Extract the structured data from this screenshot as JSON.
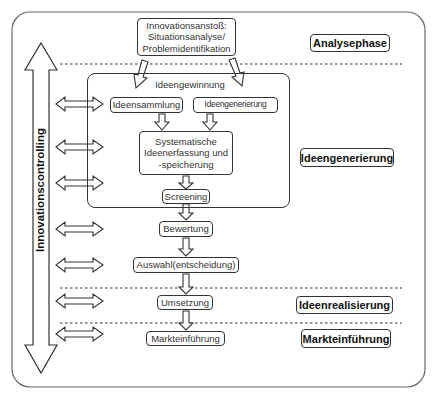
{
  "diagram": {
    "top_box": {
      "lines": "Innovationsanstoß:\nSituationsanalyse/\nProblemidentifikation"
    },
    "group": {
      "title": "Ideengewinnung"
    },
    "steps": {
      "ideensammlung": "Ideensammlung",
      "ideengenerierung": "Ideengenerierung",
      "systematische": "Systematische\nIdeenerfassung und\n-speicherung",
      "screening": "Screening",
      "bewertung": "Bewertung",
      "auswahl": "Auswahl(entscheidung)",
      "umsetzung": "Umsetzung",
      "markteinfuehrung": "Markteinführung"
    },
    "phases": {
      "analyse": "Analysephase",
      "ideengenerierung": "Ideengenerierung",
      "ideenrealisierung": "Ideenrealisierung",
      "markteinfuehrung": "Markteinführung"
    },
    "side_label": "Innovationscontrolling",
    "colors": {
      "stroke": "#333333",
      "background": "#ffffff",
      "frame": "#555555"
    }
  }
}
